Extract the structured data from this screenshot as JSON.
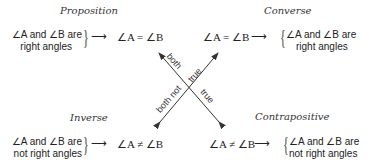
{
  "proposition": {
    "title": "Proposition",
    "hypothesis_line1": "∠A and ∠B are",
    "hypothesis_line2": "right angles",
    "conclusion": "∠A = ∠B"
  },
  "converse": {
    "title": "Converse",
    "hypothesis": "∠A = ∠B",
    "conclusion_line1": "∠A and ∠B are",
    "conclusion_line2": "right angles"
  },
  "inverse": {
    "title": "Inverse",
    "hypothesis_line1": "∠A and ∠B are",
    "hypothesis_line2": "not right angles",
    "conclusion": "∠A ≠ ∠B"
  },
  "contrapositive": {
    "title": "Contrapositive",
    "hypothesis": "∠A ≠ ∠B",
    "conclusion_line1": "∠A and ∠B are",
    "conclusion_line2": "not right angles"
  },
  "cross_labels": {
    "both_true": "both true",
    "both_not_true": "both not true",
    "true": "true",
    "both": "both",
    "true_upper": "true",
    "both_not": "both not"
  },
  "arrow_glyph": "⟶",
  "brace_glyph": "{",
  "brace_right_glyph": "}"
}
